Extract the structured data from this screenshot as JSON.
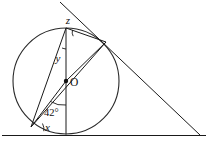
{
  "figure": {
    "type": "geometry-diagram",
    "width": 209,
    "height": 146,
    "background_color": "#ffffff",
    "stroke_color": "#1a1a1a"
  },
  "labels": {
    "center": "O",
    "angle_z": "z",
    "angle_y": "y",
    "angle_x": "x",
    "angle_known": "42°"
  },
  "geometry": {
    "circle": {
      "center_x": 66,
      "center_y": 81,
      "radius": 53
    },
    "points": {
      "top_vertex": {
        "x": 66,
        "y": 28,
        "name": "T"
      },
      "bottom_tangent_point": {
        "x": 66,
        "y": 134,
        "name": "B"
      },
      "left_point": {
        "x": 31,
        "y": 127,
        "name": "A"
      },
      "right_tangent_point": {
        "x": 106,
        "y": 42,
        "name": "C"
      },
      "external_apex": {
        "x": 200,
        "y": 135,
        "name": "P"
      },
      "tangent_upper_end": {
        "x": 60,
        "y": 2,
        "name": "Q"
      }
    },
    "segments": [
      {
        "name": "vertical-diameter",
        "from": "top_vertex",
        "to": "bottom_tangent_point"
      },
      {
        "name": "chord-top-to-left",
        "from": "top_vertex",
        "to": "left_point"
      },
      {
        "name": "chord-top-to-right-tangent",
        "from": "top_vertex",
        "to": "right_tangent_point"
      },
      {
        "name": "radius-to-right-tangent",
        "from": "center",
        "to": "right_tangent_point"
      },
      {
        "name": "line-left-to-right-tangent",
        "from": "left_point",
        "to": "right_tangent_point"
      },
      {
        "name": "radius-to-left-point",
        "from": "center",
        "to": "left_point"
      },
      {
        "name": "tangent-slant",
        "from": "tangent_upper_end",
        "to": "external_apex"
      },
      {
        "name": "tangent-horizontal",
        "from": "left_edge",
        "to": "external_apex"
      }
    ]
  },
  "annotations": {
    "angle_z_position": {
      "x": 70,
      "y": 21
    },
    "angle_y_position": {
      "x": 59,
      "y": 59
    },
    "angle_x_position": {
      "x": 47,
      "y": 127
    },
    "angle_42_position": {
      "x": 50,
      "y": 112
    },
    "center_label_position": {
      "x": 71,
      "y": 85
    }
  }
}
